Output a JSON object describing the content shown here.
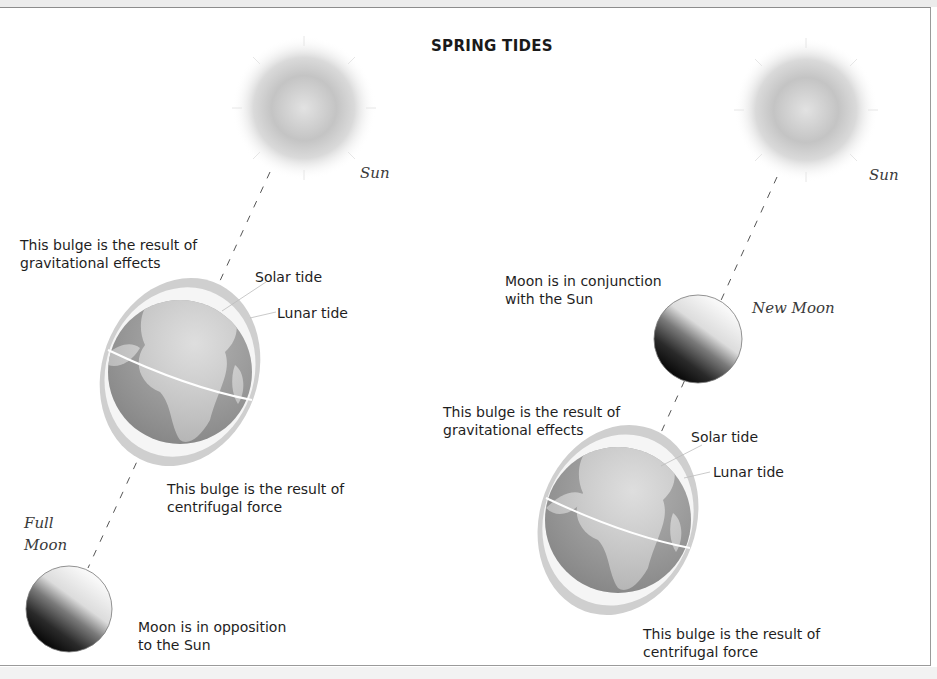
{
  "title": "SPRING TIDES",
  "left_panel": {
    "sun_label": "Sun",
    "gravitational_bulge_label": "This bulge is the result of\ngravitational effects",
    "solar_tide_label": "Solar tide",
    "lunar_tide_label": "Lunar tide",
    "centrifugal_bulge_label": "This bulge is the result of\ncentrifugal force",
    "moon_phase_label": "Full\nMoon",
    "moon_position_label": "Moon is in opposition\nto the Sun"
  },
  "right_panel": {
    "sun_label": "Sun",
    "moon_position_label": "Moon is in conjunction\nwith the Sun",
    "moon_phase_label": "New Moon",
    "gravitational_bulge_label": "This bulge is the result of\ngravitational effects",
    "solar_tide_label": "Solar tide",
    "lunar_tide_label": "Lunar tide",
    "centrifugal_bulge_label": "This bulge is the result of\ncentrifugal force"
  },
  "colors": {
    "sun_core": "#c8c8c8",
    "tide_outer": "#cfcfcf",
    "tide_inner": "#f4f4f4",
    "earth_ocean": "#9a9a9a",
    "earth_land": "#d6d6d6",
    "moon_dark": "#111111",
    "moon_light": "#f2f2f2"
  }
}
